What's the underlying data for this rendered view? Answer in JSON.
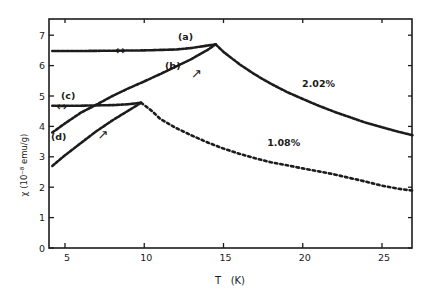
{
  "chart_data": {
    "type": "line",
    "title": "",
    "xlabel": "T   (K)",
    "ylabel": "χ  (10⁻⁸ emu/g)",
    "xlim": [
      4.0,
      27.0
    ],
    "ylim": [
      0,
      7.5
    ],
    "xticks": [
      5,
      10,
      15,
      20,
      25
    ],
    "yticks": [
      0,
      1,
      2,
      3,
      4,
      5,
      6,
      7
    ],
    "grid": false,
    "legend": "none (inline curve labels)",
    "series": [
      {
        "name": "(a)",
        "sample": "2.02%",
        "description": "field-cooled, reversible",
        "x": [
          4.2,
          6,
          8,
          10,
          12,
          13,
          14,
          14.5
        ],
        "y": [
          6.48,
          6.48,
          6.49,
          6.5,
          6.53,
          6.58,
          6.66,
          6.7
        ]
      },
      {
        "name": "(b)",
        "sample": "2.02%",
        "description": "zero-field-cooled, warming",
        "x": [
          4.2,
          5,
          6,
          7,
          8,
          9,
          10,
          11,
          12,
          13,
          14,
          14.5
        ],
        "y": [
          3.8,
          4.1,
          4.45,
          4.72,
          5.0,
          5.25,
          5.48,
          5.72,
          5.97,
          6.22,
          6.52,
          6.7
        ]
      },
      {
        "name": "2.02% (above Tf)",
        "sample": "2.02%",
        "x": [
          14.5,
          15,
          16,
          17,
          18,
          19,
          20,
          21,
          22,
          23,
          24,
          25,
          26,
          27
        ],
        "y": [
          6.7,
          6.45,
          6.05,
          5.7,
          5.4,
          5.13,
          4.9,
          4.68,
          4.48,
          4.3,
          4.12,
          3.97,
          3.83,
          3.7
        ]
      },
      {
        "name": "(c)",
        "sample": "1.08%",
        "description": "field-cooled, reversible",
        "x": [
          4.2,
          6,
          8,
          9,
          9.8
        ],
        "y": [
          4.68,
          4.68,
          4.7,
          4.73,
          4.78
        ]
      },
      {
        "name": "(d)",
        "sample": "1.08%",
        "description": "zero-field-cooled, warming",
        "x": [
          4.2,
          5,
          6,
          7,
          8,
          9,
          9.8
        ],
        "y": [
          2.7,
          3.05,
          3.45,
          3.85,
          4.2,
          4.52,
          4.78
        ]
      },
      {
        "name": "1.08% (above Tf)",
        "sample": "1.08%",
        "x": [
          9.8,
          10.5,
          11,
          12,
          13,
          14,
          15,
          16,
          17,
          18,
          19,
          20,
          21,
          22,
          23,
          24,
          25,
          26,
          27
        ],
        "y": [
          4.78,
          4.5,
          4.25,
          3.95,
          3.7,
          3.47,
          3.27,
          3.1,
          2.95,
          2.82,
          2.72,
          2.62,
          2.52,
          2.42,
          2.3,
          2.18,
          2.05,
          1.95,
          1.88
        ]
      }
    ],
    "annotations": [
      {
        "text": "(a)",
        "x": 12.6,
        "y": 6.85
      },
      {
        "text": "(b)",
        "x": 11.8,
        "y": 5.9
      },
      {
        "text": "(c)",
        "x": 5.2,
        "y": 4.9
      },
      {
        "text": "(d)",
        "x": 4.6,
        "y": 3.55
      },
      {
        "text": "2.02%",
        "x": 21.0,
        "y": 5.3
      },
      {
        "text": "1.08%",
        "x": 18.8,
        "y": 3.35
      },
      {
        "text": "↔",
        "x": 8.5,
        "y": 6.35,
        "meaning": "reversible"
      },
      {
        "text": "↔",
        "x": 4.8,
        "y": 4.5,
        "meaning": "reversible"
      },
      {
        "text": "↗",
        "x": 13.3,
        "y": 5.6,
        "meaning": "warming"
      },
      {
        "text": "↗",
        "x": 7.4,
        "y": 3.6,
        "meaning": "warming"
      }
    ]
  }
}
